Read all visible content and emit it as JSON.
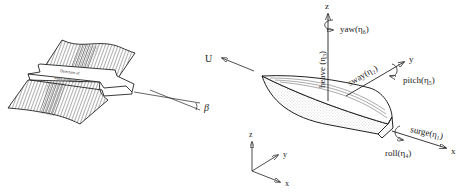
{
  "wave_panel": {
    "arrow_text_line1": "Direction of",
    "arrow_text_line2": "wave propagation",
    "angle_label": "β"
  },
  "ship_panel": {
    "velocity_label": "U",
    "axes": {
      "z": "z",
      "y": "y",
      "x": "x"
    },
    "motions": {
      "heave": "heave (η₃)",
      "yaw": "yaw(η₆)",
      "sway": "sway(η₂)",
      "pitch": "pitch(η₅)",
      "surge": "surge(η₁)",
      "roll": "roll(η₄)"
    }
  },
  "reference_frame": {
    "z": "z",
    "y": "y",
    "x": "x"
  },
  "colors": {
    "line": "#222222",
    "background": "#ffffff"
  }
}
